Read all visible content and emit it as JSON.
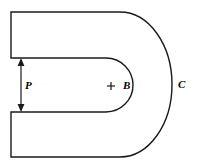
{
  "figure": {
    "background_color": "#ffffff",
    "stroke_color": "#1a1a1a",
    "stroke_width": 1.4,
    "width": 199,
    "height": 167,
    "labels": {
      "gap_dimension": "P",
      "centroid": "B",
      "outer_curve": "C"
    },
    "markers": {
      "centroid_cross": "+"
    },
    "icons": {
      "dimension_arrow": "double-headed-arrow-icon",
      "centroid_cross": "cross-marker-icon"
    },
    "geometry": {
      "outline": {
        "top_edge_y": 12,
        "bottom_edge_y": 157,
        "left_edge_x": 11,
        "outer_arc_center_x": 120,
        "outer_arc_center_y": 84.5,
        "outer_arc_radius_x": 52,
        "outer_arc_radius_y": 72.5,
        "slot_top_y": 58,
        "slot_bottom_y": 112,
        "inner_arc_center_x": 106,
        "inner_arc_center_y": 85,
        "inner_arc_radius_x": 27,
        "inner_arc_radius_y": 27
      },
      "dimension_arrow": {
        "x": 21,
        "y_top": 59,
        "y_bottom": 111,
        "label": "P"
      },
      "centroid_marker": {
        "x": 111,
        "y": 86,
        "size": 8
      }
    }
  }
}
